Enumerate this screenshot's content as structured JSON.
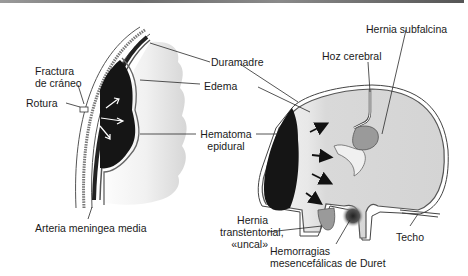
{
  "figure": {
    "left_panel": {
      "labels": {
        "fractura": "Fractura\nde cráneo",
        "fractura_l1": "Fractura",
        "fractura_l2": "de cráneo",
        "rotura": "Rotura",
        "arteria": "Arteria meningea media"
      }
    },
    "center_labels": {
      "duramadre": "Duramadre",
      "edema": "Edema",
      "hematoma_l1": "Hematoma",
      "hematoma_l2": "epidural"
    },
    "right_panel": {
      "labels": {
        "hernia_subfalcina": "Hernia subfalcina",
        "hoz_cerebral": "Hoz cerebral",
        "hernia_trans_l1": "Hernia",
        "hernia_trans_l2": "transtentorial,",
        "hernia_trans_l3": "«uncal»",
        "hemorragias_l1": "Hemorragias",
        "hemorragias_l2": "mesencefálicas de Duret",
        "techo": "Techo"
      }
    },
    "colors": {
      "hematoma": "#151515",
      "brain_fill": "#dcdcdc",
      "edema_fill": "#f2f2f2",
      "herniation": "#9a9a9a",
      "outline": "#3a3a3a",
      "leader_line": "#2a2a2a"
    }
  }
}
